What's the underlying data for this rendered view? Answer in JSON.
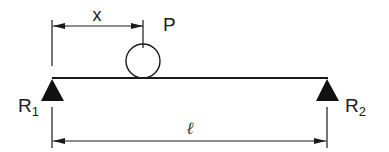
{
  "diagram": {
    "type": "simply-supported beam with point load",
    "labels": {
      "distance": "x",
      "load": "P",
      "left_reaction": "R",
      "left_reaction_sub": "1",
      "right_reaction": "R",
      "right_reaction_sub": "2",
      "span": "ℓ"
    },
    "colors": {
      "line": "#1a1a1a",
      "background": "#ffffff"
    }
  }
}
